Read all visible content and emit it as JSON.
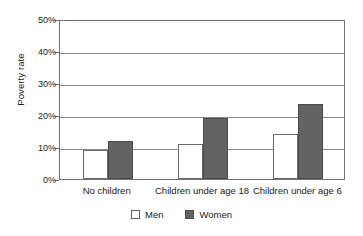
{
  "chart_data": {
    "type": "bar",
    "title": "",
    "xlabel": "",
    "ylabel": "Poverty rate",
    "ylim": [
      0,
      50
    ],
    "ytick_labels": [
      "0%",
      "10%",
      "20%",
      "30%",
      "40%",
      "50%"
    ],
    "ytick_values": [
      0,
      10,
      20,
      30,
      40,
      50
    ],
    "grid": true,
    "legend_position": "bottom",
    "categories": [
      "No children",
      "Children under age 18",
      "Children under age 6"
    ],
    "series": [
      {
        "name": "Men",
        "color": "#ffffff",
        "values": [
          9,
          11,
          14
        ]
      },
      {
        "name": "Women",
        "color": "#636363",
        "values": [
          12,
          19,
          23.5
        ]
      }
    ]
  },
  "legend": {
    "items": [
      {
        "label": "Men"
      },
      {
        "label": "Women"
      }
    ]
  }
}
